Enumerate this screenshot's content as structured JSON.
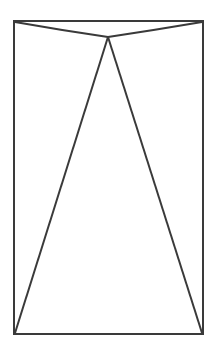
{
  "diagram": {
    "stroke_color": "#3a3a3a",
    "rectangle": {
      "x": 14,
      "y": 21,
      "width": 189,
      "height": 313
    },
    "apex": {
      "x": 108,
      "y": 37
    },
    "bottom_left": {
      "x": 15,
      "y": 333
    },
    "bottom_right": {
      "x": 202,
      "y": 333
    }
  }
}
